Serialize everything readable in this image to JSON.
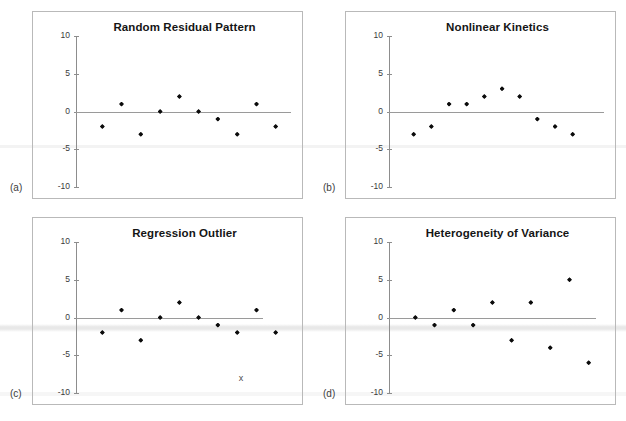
{
  "figure": {
    "background_color": "#ffffff",
    "axis_color": "#8d8d8d",
    "zero_line_color": "#9a9a9a",
    "marker_color": "#0c0c0c",
    "panel_border_color": "#b9b9b9"
  },
  "panels": [
    {
      "letter": "(a)",
      "title": "Random Residual Pattern",
      "chart_data": {
        "type": "scatter",
        "title": "Random Residual Pattern",
        "xlabel": "",
        "ylabel": "",
        "ylim": [
          -10,
          10
        ],
        "yticks": [
          10,
          5,
          0,
          -5,
          -10
        ],
        "ytick_labels": [
          "10",
          "5",
          "0",
          "-5",
          "-10"
        ],
        "xlim": [
          0,
          11
        ],
        "grid": false,
        "legend": "none",
        "zero_reference_line": 0,
        "x": [
          1,
          2,
          3,
          4,
          5,
          6,
          7,
          8,
          9,
          10
        ],
        "values": [
          -2,
          1,
          -3,
          0,
          2,
          0,
          -1,
          -3,
          1,
          -2
        ],
        "annotations": []
      }
    },
    {
      "letter": "(b)",
      "title": "Nonlinear Kinetics",
      "chart_data": {
        "type": "scatter",
        "title": "Nonlinear Kinetics",
        "xlabel": "",
        "ylabel": "",
        "ylim": [
          -10,
          10
        ],
        "yticks": [
          10,
          5,
          0,
          -5,
          -10
        ],
        "ytick_labels": [
          "10",
          "5",
          "0",
          "-5",
          "-10"
        ],
        "xlim": [
          0,
          12
        ],
        "grid": false,
        "legend": "none",
        "zero_reference_line": 0,
        "x": [
          1,
          2,
          3,
          4,
          5,
          6,
          7,
          8,
          9,
          10,
          11
        ],
        "values": [
          -3,
          -2,
          1,
          1,
          2,
          3,
          2,
          -1,
          -2,
          -3
        ],
        "annotations": []
      }
    },
    {
      "letter": "(c)",
      "title": "Regression Outlier",
      "chart_data": {
        "type": "scatter",
        "title": "Regression Outlier",
        "xlabel": "",
        "ylabel": "",
        "ylim": [
          -10,
          10
        ],
        "yticks": [
          10,
          5,
          0,
          -5,
          -10
        ],
        "ytick_labels": [
          "10",
          "5",
          "0",
          "-5",
          "-10"
        ],
        "xlim": [
          0,
          11
        ],
        "grid": false,
        "legend": "none",
        "zero_reference_line": 0,
        "x": [
          1,
          2,
          3,
          4,
          5,
          6,
          7,
          8,
          9,
          10
        ],
        "values": [
          -2,
          1,
          -3,
          0,
          2,
          0,
          -1,
          -2,
          1,
          -2
        ],
        "annotations": [
          {
            "label": "x",
            "x": 8.2,
            "y": -8,
            "note": "outlier marker"
          }
        ]
      }
    },
    {
      "letter": "(d)",
      "title": "Heterogeneity of Variance",
      "chart_data": {
        "type": "scatter",
        "title": "Heterogeneity of Variance",
        "xlabel": "",
        "ylabel": "",
        "ylim": [
          -10,
          10
        ],
        "yticks": [
          10,
          5,
          0,
          -5,
          -10
        ],
        "ytick_labels": [
          "10",
          "5",
          "0",
          "-5",
          "-10"
        ],
        "xlim": [
          0,
          11
        ],
        "grid": false,
        "legend": "none",
        "zero_reference_line": 0,
        "x": [
          1,
          2,
          3,
          4,
          5,
          6,
          7,
          8,
          9,
          10
        ],
        "values": [
          0,
          -1,
          1,
          -1,
          2,
          -3,
          2,
          -4,
          5,
          -6
        ],
        "annotations": []
      }
    }
  ]
}
